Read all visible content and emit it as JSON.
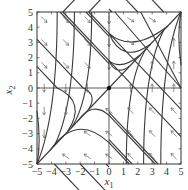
{
  "figure": {
    "type": "phase-portrait",
    "xlabel": "x",
    "xlabel_sub": "1",
    "ylabel": "x",
    "ylabel_sub": "2",
    "xlim": [
      -5,
      5
    ],
    "ylim": [
      -5,
      5
    ],
    "xticks": [
      "−5",
      "−4",
      "−3",
      "−2",
      "−1",
      "0",
      "1",
      "2",
      "3",
      "4",
      "5"
    ],
    "yticks": [
      "−5",
      "−4",
      "−3",
      "−2",
      "−1",
      "0",
      "1",
      "2",
      "3",
      "4",
      "5"
    ],
    "fixed_point": [
      0,
      0
    ],
    "invariant_line": "x2 = x1",
    "colors": {
      "trajectory": "#3a3a3a",
      "arrow": "#666666",
      "axis": "#333333"
    }
  },
  "frame": {
    "left": 37,
    "top": 12,
    "right": 181,
    "bottom": 164
  },
  "trajectories": {
    "straight_upper_c": [
      -3.6,
      -1.8,
      1.8,
      3.6,
      5.4,
      7.2
    ],
    "straight_lower_c": [
      -7.2,
      -5.4,
      -3.6,
      -1.8,
      1.8,
      3.6
    ]
  },
  "arrows": {
    "upper_left_dir": [
      0.7,
      -0.7
    ],
    "lower_right_dir": [
      -0.7,
      0.7
    ],
    "upper_right_dir_above": [
      0.8,
      -0.5
    ],
    "upper_right_dir_below": [
      0,
      1
    ],
    "lower_left_dir_above": [
      0,
      -1
    ],
    "lower_left_dir_below": [
      -0.6,
      0.4
    ]
  }
}
